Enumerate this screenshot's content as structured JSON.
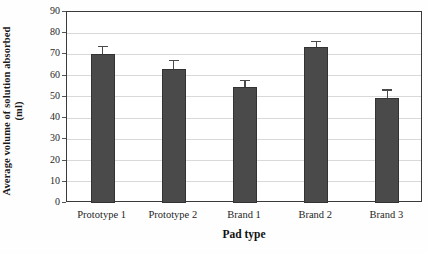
{
  "chart_data": {
    "type": "bar",
    "title": "",
    "xlabel": "Pad type",
    "ylabel_line1": "Average volume of solution absorbed",
    "ylabel_line2": "(ml)",
    "categories": [
      "Prototype 1",
      "Prototype 2",
      "Brand 1",
      "Brand 2",
      "Brand 3"
    ],
    "values": [
      70,
      63,
      54.5,
      73.5,
      49.5
    ],
    "errors": [
      4,
      4.5,
      3.5,
      3,
      4
    ],
    "ylim": [
      0,
      90
    ],
    "ytick_labels": [
      "0",
      "10",
      "20",
      "30",
      "40",
      "50",
      "60",
      "70",
      "80",
      "90"
    ],
    "ytick_values": [
      0,
      10,
      20,
      30,
      40,
      50,
      60,
      70,
      80,
      90
    ],
    "grid": true,
    "legend": "none",
    "bar_color": "#4a4a4a",
    "grid_color": "#d9d9d9",
    "frame_color": "#3a3a3a"
  }
}
